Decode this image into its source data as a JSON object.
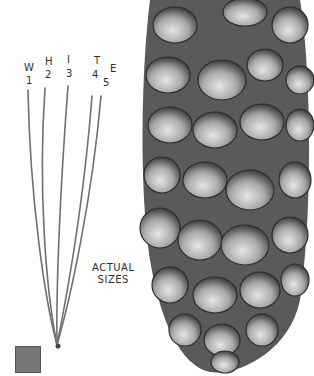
{
  "illustration": {
    "subject": "White pine needles and cone",
    "needle_labels": [
      {
        "letter": "W",
        "number": "1"
      },
      {
        "letter": "H",
        "number": "2"
      },
      {
        "letter": "I",
        "number": "3"
      },
      {
        "letter": "T",
        "number": "4"
      },
      {
        "letter": "E",
        "number": "5"
      }
    ],
    "caption_line1": "ACTUAL",
    "caption_line2": "SIZES",
    "colors": {
      "needle": "#6e6e6e",
      "cone_dark": "#3a3a3a",
      "cone_mid": "#8a8a8a",
      "cone_light": "#d8d8d8",
      "swatch": "#777777"
    }
  }
}
